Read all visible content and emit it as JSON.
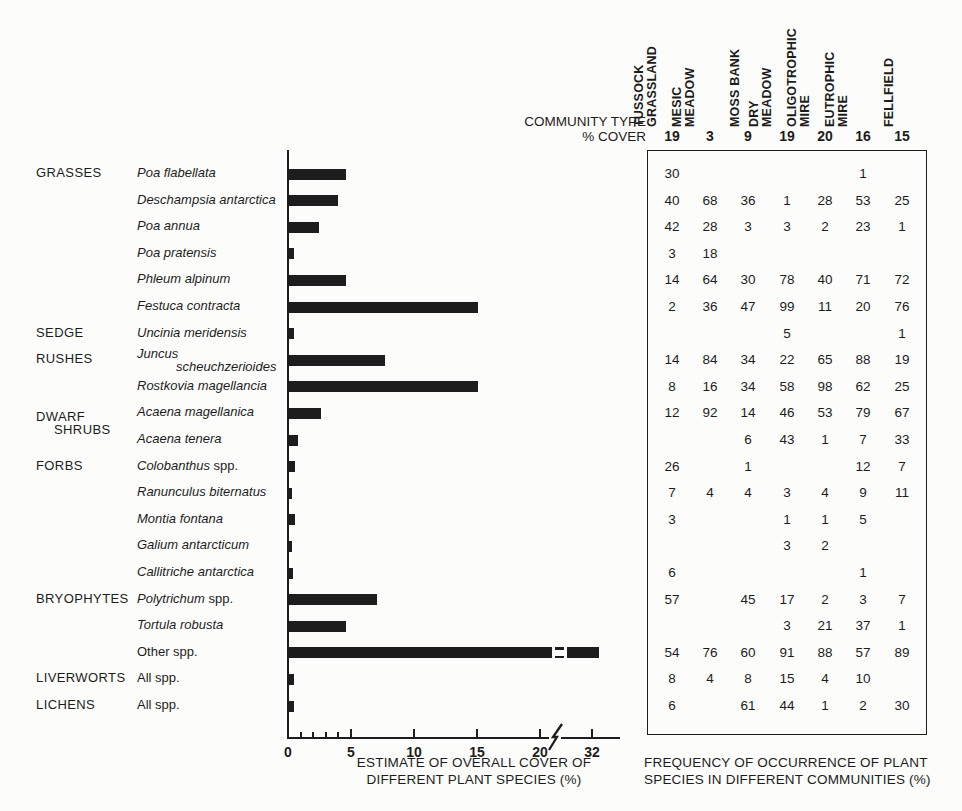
{
  "page": {
    "ink_color": "#1c1c1c",
    "bar_color": "#1d1d1d",
    "background_color": "#fcfcfa"
  },
  "chart_data": {
    "type": "bar",
    "orientation": "horizontal",
    "xlabel_line1": "ESTIMATE OF OVERALL COVER OF",
    "xlabel_line2": "DIFFERENT PLANT SPECIES (%)",
    "x_axis": {
      "major_ticks": [
        0,
        5,
        10,
        15,
        20
      ],
      "minor_ticks": [
        1,
        2,
        3,
        4
      ],
      "break_after": 20,
      "tick_after_break": 32,
      "unit": "%"
    },
    "groups": [
      {
        "row": 0,
        "lines": [
          "GRASSES"
        ]
      },
      {
        "row": 6,
        "lines": [
          "SEDGE"
        ]
      },
      {
        "row": 7,
        "lines": [
          "RUSHES"
        ]
      },
      {
        "row": 9,
        "lines": [
          "DWARF",
          "SHRUBS"
        ]
      },
      {
        "row": 11,
        "lines": [
          "FORBS"
        ]
      },
      {
        "row": 16,
        "lines": [
          "BRYOPHYTES"
        ]
      },
      {
        "row": 19,
        "lines": [
          "LIVERWORTS"
        ]
      },
      {
        "row": 20,
        "lines": [
          "LICHENS"
        ]
      }
    ],
    "rows": [
      {
        "species_italic": "Poa flabellata",
        "species_roman": "",
        "cover_pct": 4.5,
        "freq": [
          "30",
          "",
          "",
          "",
          "",
          "1",
          ""
        ]
      },
      {
        "species_italic": "Deschampsia antarctica",
        "species_roman": "",
        "cover_pct": 3.9,
        "freq": [
          "40",
          "68",
          "36",
          "1",
          "28",
          "53",
          "25"
        ]
      },
      {
        "species_italic": "Poa annua",
        "species_roman": "",
        "cover_pct": 2.4,
        "freq": [
          "42",
          "28",
          "3",
          "3",
          "2",
          "23",
          "1"
        ]
      },
      {
        "species_italic": "Poa pratensis",
        "species_roman": "",
        "cover_pct": 0.4,
        "freq": [
          "3",
          "18",
          "",
          "",
          "",
          "",
          ""
        ]
      },
      {
        "species_italic": "Phleum alpinum",
        "species_roman": "",
        "cover_pct": 4.5,
        "freq": [
          "14",
          "64",
          "30",
          "78",
          "40",
          "71",
          "72"
        ]
      },
      {
        "species_italic": "Festuca contracta",
        "species_roman": "",
        "cover_pct": 15,
        "freq": [
          "2",
          "36",
          "47",
          "99",
          "11",
          "20",
          "76"
        ]
      },
      {
        "species_italic": "Uncinia meridensis",
        "species_roman": "",
        "cover_pct": 0.4,
        "freq": [
          "",
          "",
          "",
          "5",
          "",
          "",
          "1"
        ]
      },
      {
        "species_italic": "Juncus",
        "species_roman": "",
        "species_line2_italic": "scheuchzerioides",
        "cover_pct": 7.6,
        "freq": [
          "14",
          "84",
          "34",
          "22",
          "65",
          "88",
          "19"
        ]
      },
      {
        "species_italic": "Rostkovia magellancia",
        "species_roman": "",
        "cover_pct": 15,
        "freq": [
          "8",
          "16",
          "34",
          "58",
          "98",
          "62",
          "25"
        ]
      },
      {
        "species_italic": "Acaena magellanica",
        "species_roman": "",
        "cover_pct": 2.5,
        "freq": [
          "12",
          "92",
          "14",
          "46",
          "53",
          "79",
          "67"
        ]
      },
      {
        "species_italic": "Acaena tenera",
        "species_roman": "",
        "cover_pct": 0.7,
        "freq": [
          "",
          "",
          "6",
          "43",
          "1",
          "7",
          "33"
        ]
      },
      {
        "species_italic": "Colobanthus",
        "species_roman": " spp.",
        "cover_pct": 0.5,
        "freq": [
          "26",
          "",
          "1",
          "",
          "",
          "12",
          "7"
        ]
      },
      {
        "species_italic": "Ranunculus biternatus",
        "species_roman": "",
        "cover_pct": 0.2,
        "freq": [
          "7",
          "4",
          "4",
          "3",
          "4",
          "9",
          "11"
        ]
      },
      {
        "species_italic": "Montia fontana",
        "species_roman": "",
        "cover_pct": 0.5,
        "freq": [
          "3",
          "",
          "",
          "1",
          "1",
          "5",
          ""
        ]
      },
      {
        "species_italic": "Galium antarcticum",
        "species_roman": "",
        "cover_pct": 0.2,
        "freq": [
          "",
          "",
          "",
          "3",
          "2",
          "",
          ""
        ]
      },
      {
        "species_italic": "Callitriche antarctica",
        "species_roman": "",
        "cover_pct": 0.3,
        "freq": [
          "6",
          "",
          "",
          "",
          "",
          "1",
          ""
        ]
      },
      {
        "species_italic": "Polytrichum",
        "species_roman": " spp.",
        "cover_pct": 7.0,
        "freq": [
          "57",
          "",
          "45",
          "17",
          "2",
          "3",
          "7"
        ]
      },
      {
        "species_italic": "Tortula robusta",
        "species_roman": "",
        "cover_pct": 4.5,
        "freq": [
          "",
          "",
          "",
          "3",
          "21",
          "37",
          "1"
        ]
      },
      {
        "species_italic": "",
        "species_roman": "Other spp.",
        "cover_pct": 32,
        "has_break": true,
        "freq": [
          "54",
          "76",
          "60",
          "91",
          "88",
          "57",
          "89"
        ]
      },
      {
        "species_italic": "",
        "species_roman": "All spp.",
        "cover_pct": 0.4,
        "freq": [
          "8",
          "4",
          "8",
          "15",
          "4",
          "10",
          ""
        ]
      },
      {
        "species_italic": "",
        "species_roman": "All spp.",
        "cover_pct": 0.4,
        "freq": [
          "6",
          "",
          "61",
          "44",
          "1",
          "2",
          "30"
        ]
      }
    ],
    "table": {
      "header_row1": "COMMUNITY TYPE",
      "header_row2": "% COVER",
      "columns": [
        {
          "label_lines": [
            "TUSSOCK",
            "GRASSLAND"
          ],
          "cover": "19"
        },
        {
          "label_lines": [
            "MESIC",
            "MEADOW"
          ],
          "cover": "3"
        },
        {
          "label_lines": [
            "MOSS BANK"
          ],
          "cover": "9"
        },
        {
          "label_lines": [
            "DRY",
            "MEADOW"
          ],
          "cover": "19"
        },
        {
          "label_lines": [
            "OLIGOTROPHIC",
            "MIRE"
          ],
          "cover": "20"
        },
        {
          "label_lines": [
            "EUTROPHIC",
            "MIRE"
          ],
          "cover": "16"
        },
        {
          "label_lines": [
            "FELLFIELD"
          ],
          "cover": "15"
        }
      ],
      "caption_line1": "FREQUENCY OF OCCURRENCE OF PLANT",
      "caption_line2": "SPECIES IN DIFFERENT COMMUNITIES (%)"
    }
  }
}
